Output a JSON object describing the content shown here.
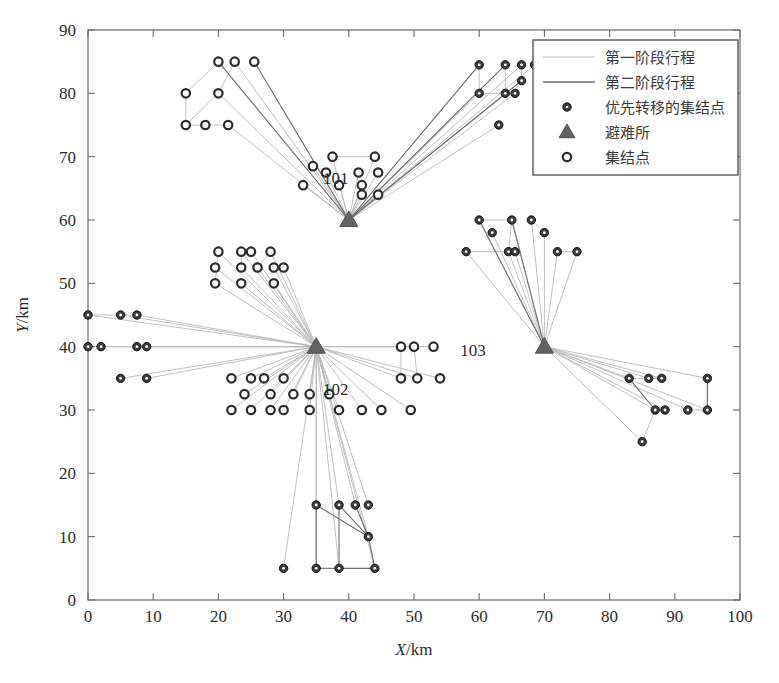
{
  "figure": {
    "background": "#ffffff",
    "axis_color": "#6b6b6b",
    "stage1_color": "#b9b9b9",
    "stage2_color": "#6e6e6e",
    "priority_node_color": "#3a3a3a",
    "assembly_node_color": "#2b2b2b",
    "shelter_color": "#636363"
  },
  "axes": {
    "x_title_var": "X",
    "x_title_unit": "/km",
    "y_title_var": "Y",
    "y_title_unit": "/km",
    "x_ticks": [
      0,
      10,
      20,
      30,
      40,
      50,
      60,
      70,
      80,
      90,
      100
    ],
    "y_ticks": [
      0,
      10,
      20,
      30,
      40,
      50,
      60,
      70,
      80,
      90
    ],
    "xlim": [
      0,
      100
    ],
    "ylim": [
      0,
      90
    ]
  },
  "legend": {
    "position": "top-right",
    "entries": [
      {
        "label": "第一阶段行程",
        "marker": "line-light"
      },
      {
        "label": "第二阶段行程",
        "marker": "line-dark"
      },
      {
        "label": "优先转移的集结点",
        "marker": "filled-circle"
      },
      {
        "label": "避难所",
        "marker": "filled-triangle"
      },
      {
        "label": "集结点",
        "marker": "hollow-circle"
      }
    ]
  },
  "chart_data": {
    "type": "scatter",
    "title": "",
    "xlabel": "X/km",
    "ylabel": "Y/km",
    "xlim": [
      0,
      100
    ],
    "ylim": [
      0,
      90
    ],
    "grid": false,
    "legend_position": "top-right",
    "series": [
      {
        "name": "避难所",
        "marker": "filled-triangle",
        "points": [
          {
            "x": 40,
            "y": 60,
            "label": "101",
            "label_dx": -2,
            "label_dy": -9
          },
          {
            "x": 35,
            "y": 40,
            "label": "102",
            "label_dx": 3,
            "label_dy": 4
          },
          {
            "x": 70,
            "y": 40,
            "label": "103",
            "label_dx": -11,
            "label_dy": -2
          }
        ]
      },
      {
        "name": "优先转移的集结点",
        "marker": "filled-circle",
        "points": [
          {
            "x": 60,
            "y": 84.5
          },
          {
            "x": 64,
            "y": 84.5
          },
          {
            "x": 66.5,
            "y": 84.5
          },
          {
            "x": 68.5,
            "y": 84.5
          },
          {
            "x": 60,
            "y": 80
          },
          {
            "x": 64,
            "y": 80
          },
          {
            "x": 65.5,
            "y": 80
          },
          {
            "x": 66.5,
            "y": 82
          },
          {
            "x": 63,
            "y": 75
          },
          {
            "x": 60,
            "y": 60
          },
          {
            "x": 65,
            "y": 60
          },
          {
            "x": 68,
            "y": 60
          },
          {
            "x": 62,
            "y": 58
          },
          {
            "x": 70,
            "y": 58
          },
          {
            "x": 64.5,
            "y": 55
          },
          {
            "x": 65.5,
            "y": 55
          },
          {
            "x": 72,
            "y": 55
          },
          {
            "x": 75,
            "y": 55
          },
          {
            "x": 58,
            "y": 55
          },
          {
            "x": 83,
            "y": 35
          },
          {
            "x": 86,
            "y": 35
          },
          {
            "x": 88,
            "y": 35
          },
          {
            "x": 95,
            "y": 35
          },
          {
            "x": 87,
            "y": 30
          },
          {
            "x": 88.5,
            "y": 30
          },
          {
            "x": 92,
            "y": 30
          },
          {
            "x": 95,
            "y": 30
          },
          {
            "x": 85,
            "y": 25
          },
          {
            "x": 35,
            "y": 15
          },
          {
            "x": 38.5,
            "y": 15
          },
          {
            "x": 41,
            "y": 15
          },
          {
            "x": 43,
            "y": 15
          },
          {
            "x": 43,
            "y": 10
          },
          {
            "x": 30,
            "y": 5
          },
          {
            "x": 35,
            "y": 5
          },
          {
            "x": 38.5,
            "y": 5
          },
          {
            "x": 44,
            "y": 5
          },
          {
            "x": 0,
            "y": 45
          },
          {
            "x": 5,
            "y": 45
          },
          {
            "x": 7.5,
            "y": 45
          },
          {
            "x": 0,
            "y": 40
          },
          {
            "x": 2,
            "y": 40
          },
          {
            "x": 7.5,
            "y": 40
          },
          {
            "x": 9,
            "y": 40
          },
          {
            "x": 5,
            "y": 35
          },
          {
            "x": 9,
            "y": 35
          }
        ]
      },
      {
        "name": "集结点",
        "marker": "hollow-circle",
        "points": [
          {
            "x": 20,
            "y": 85
          },
          {
            "x": 22.5,
            "y": 85
          },
          {
            "x": 25.5,
            "y": 85
          },
          {
            "x": 15,
            "y": 80
          },
          {
            "x": 20,
            "y": 80
          },
          {
            "x": 15,
            "y": 75
          },
          {
            "x": 18,
            "y": 75
          },
          {
            "x": 21.5,
            "y": 75
          },
          {
            "x": 37.5,
            "y": 70
          },
          {
            "x": 44,
            "y": 70
          },
          {
            "x": 34.5,
            "y": 68.5
          },
          {
            "x": 36.5,
            "y": 67.5
          },
          {
            "x": 41.5,
            "y": 67.5
          },
          {
            "x": 44.5,
            "y": 67.5
          },
          {
            "x": 33,
            "y": 65.5
          },
          {
            "x": 38.5,
            "y": 65.5
          },
          {
            "x": 42,
            "y": 65.5
          },
          {
            "x": 42,
            "y": 64
          },
          {
            "x": 44.5,
            "y": 64
          },
          {
            "x": 20,
            "y": 55
          },
          {
            "x": 23.5,
            "y": 55
          },
          {
            "x": 25,
            "y": 55
          },
          {
            "x": 28,
            "y": 55
          },
          {
            "x": 19.5,
            "y": 52.5
          },
          {
            "x": 23.5,
            "y": 52.5
          },
          {
            "x": 26,
            "y": 52.5
          },
          {
            "x": 28.5,
            "y": 52.5
          },
          {
            "x": 30,
            "y": 52.5
          },
          {
            "x": 19.5,
            "y": 50
          },
          {
            "x": 23.5,
            "y": 50
          },
          {
            "x": 28.5,
            "y": 50
          },
          {
            "x": 48,
            "y": 40
          },
          {
            "x": 50,
            "y": 40
          },
          {
            "x": 53,
            "y": 40
          },
          {
            "x": 22,
            "y": 35
          },
          {
            "x": 25,
            "y": 35
          },
          {
            "x": 27,
            "y": 35
          },
          {
            "x": 30,
            "y": 35
          },
          {
            "x": 48,
            "y": 35
          },
          {
            "x": 50.5,
            "y": 35
          },
          {
            "x": 54,
            "y": 35
          },
          {
            "x": 24,
            "y": 32.5
          },
          {
            "x": 28,
            "y": 32.5
          },
          {
            "x": 31.5,
            "y": 32.5
          },
          {
            "x": 34,
            "y": 32.5
          },
          {
            "x": 37,
            "y": 32.5
          },
          {
            "x": 22,
            "y": 30
          },
          {
            "x": 25,
            "y": 30
          },
          {
            "x": 28,
            "y": 30
          },
          {
            "x": 30,
            "y": 30
          },
          {
            "x": 34,
            "y": 30
          },
          {
            "x": 38.5,
            "y": 30
          },
          {
            "x": 42,
            "y": 30
          },
          {
            "x": 45,
            "y": 30
          },
          {
            "x": 49.5,
            "y": 30
          }
        ]
      }
    ],
    "stage1_edges": [
      [
        20,
        85,
        40,
        60
      ],
      [
        22.5,
        85,
        40,
        60
      ],
      [
        25.5,
        85,
        40,
        60
      ],
      [
        15,
        80,
        20,
        85
      ],
      [
        20,
        80,
        22.5,
        85
      ],
      [
        15,
        80,
        15,
        75
      ],
      [
        15,
        75,
        18,
        75
      ],
      [
        18,
        75,
        21.5,
        75
      ],
      [
        21.5,
        75,
        40,
        60
      ],
      [
        20,
        80,
        40,
        60
      ],
      [
        15,
        75,
        20,
        80
      ],
      [
        37.5,
        70,
        40,
        60
      ],
      [
        44,
        70,
        40,
        60
      ],
      [
        37.5,
        70,
        44,
        70
      ],
      [
        34.5,
        68.5,
        40,
        60
      ],
      [
        36.5,
        67.5,
        40,
        60
      ],
      [
        41.5,
        67.5,
        40,
        60
      ],
      [
        44.5,
        67.5,
        40,
        60
      ],
      [
        33,
        65.5,
        40,
        60
      ],
      [
        38.5,
        65.5,
        40,
        60
      ],
      [
        42,
        65.5,
        40,
        60
      ],
      [
        42,
        64,
        40,
        60
      ],
      [
        44.5,
        64,
        40,
        60
      ],
      [
        60,
        84.5,
        40,
        60
      ],
      [
        64,
        84.5,
        40,
        60
      ],
      [
        66.5,
        84.5,
        40,
        60
      ],
      [
        68.5,
        84.5,
        40,
        60
      ],
      [
        60,
        80,
        40,
        60
      ],
      [
        64,
        80,
        40,
        60
      ],
      [
        65.5,
        80,
        40,
        60
      ],
      [
        66.5,
        82,
        40,
        60
      ],
      [
        63,
        75,
        40,
        60
      ],
      [
        60,
        84.5,
        60,
        80
      ],
      [
        64,
        84.5,
        64,
        80
      ],
      [
        66.5,
        84.5,
        66.5,
        82
      ],
      [
        60,
        80,
        64,
        80
      ],
      [
        20,
        55,
        35,
        40
      ],
      [
        23.5,
        55,
        35,
        40
      ],
      [
        25,
        55,
        35,
        40
      ],
      [
        28,
        55,
        35,
        40
      ],
      [
        19.5,
        52.5,
        35,
        40
      ],
      [
        23.5,
        52.5,
        35,
        40
      ],
      [
        26,
        52.5,
        35,
        40
      ],
      [
        28.5,
        52.5,
        35,
        40
      ],
      [
        30,
        52.5,
        35,
        40
      ],
      [
        19.5,
        50,
        35,
        40
      ],
      [
        23.5,
        50,
        35,
        40
      ],
      [
        28.5,
        50,
        35,
        40
      ],
      [
        20,
        55,
        19.5,
        50
      ],
      [
        23.5,
        55,
        23.5,
        52.5
      ],
      [
        26,
        52.5,
        28,
        55
      ],
      [
        0,
        45,
        35,
        40
      ],
      [
        5,
        45,
        35,
        40
      ],
      [
        7.5,
        45,
        35,
        40
      ],
      [
        0,
        40,
        35,
        40
      ],
      [
        2,
        40,
        35,
        40
      ],
      [
        7.5,
        40,
        35,
        40
      ],
      [
        9,
        40,
        35,
        40
      ],
      [
        5,
        35,
        35,
        40
      ],
      [
        9,
        35,
        35,
        40
      ],
      [
        0,
        45,
        5,
        45
      ],
      [
        5,
        45,
        7.5,
        45
      ],
      [
        22,
        35,
        35,
        40
      ],
      [
        25,
        35,
        35,
        40
      ],
      [
        27,
        35,
        35,
        40
      ],
      [
        30,
        35,
        35,
        40
      ],
      [
        24,
        32.5,
        35,
        40
      ],
      [
        28,
        32.5,
        35,
        40
      ],
      [
        31.5,
        32.5,
        35,
        40
      ],
      [
        34,
        32.5,
        35,
        40
      ],
      [
        37,
        32.5,
        35,
        40
      ],
      [
        22,
        30,
        35,
        40
      ],
      [
        25,
        30,
        35,
        40
      ],
      [
        28,
        30,
        35,
        40
      ],
      [
        30,
        30,
        35,
        40
      ],
      [
        34,
        30,
        35,
        40
      ],
      [
        38.5,
        30,
        35,
        40
      ],
      [
        42,
        30,
        35,
        40
      ],
      [
        45,
        30,
        35,
        40
      ],
      [
        49.5,
        30,
        35,
        40
      ],
      [
        48,
        40,
        35,
        40
      ],
      [
        50,
        40,
        35,
        40
      ],
      [
        53,
        40,
        35,
        40
      ],
      [
        48,
        35,
        35,
        40
      ],
      [
        50.5,
        35,
        35,
        40
      ],
      [
        54,
        35,
        35,
        40
      ],
      [
        48,
        40,
        48,
        35
      ],
      [
        50,
        40,
        50.5,
        35
      ],
      [
        60,
        60,
        70,
        40
      ],
      [
        65,
        60,
        70,
        40
      ],
      [
        68,
        60,
        70,
        40
      ],
      [
        62,
        58,
        70,
        40
      ],
      [
        70,
        58,
        70,
        40
      ],
      [
        64.5,
        55,
        70,
        40
      ],
      [
        65.5,
        55,
        70,
        40
      ],
      [
        72,
        55,
        70,
        40
      ],
      [
        75,
        55,
        70,
        40
      ],
      [
        58,
        55,
        70,
        40
      ],
      [
        60,
        60,
        65,
        60
      ],
      [
        65,
        60,
        64.5,
        55
      ],
      [
        68,
        60,
        70,
        58
      ],
      [
        72,
        55,
        75,
        55
      ],
      [
        58,
        55,
        64.5,
        55
      ],
      [
        83,
        35,
        70,
        40
      ],
      [
        86,
        35,
        70,
        40
      ],
      [
        88,
        35,
        70,
        40
      ],
      [
        95,
        35,
        70,
        40
      ],
      [
        87,
        30,
        70,
        40
      ],
      [
        88.5,
        30,
        70,
        40
      ],
      [
        92,
        30,
        70,
        40
      ],
      [
        95,
        30,
        70,
        40
      ],
      [
        85,
        25,
        70,
        40
      ],
      [
        83,
        35,
        86,
        35
      ],
      [
        86,
        35,
        88,
        35
      ],
      [
        95,
        35,
        95,
        30
      ],
      [
        92,
        30,
        95,
        30
      ],
      [
        85,
        25,
        87,
        30
      ],
      [
        35,
        15,
        35,
        40
      ],
      [
        38.5,
        15,
        35,
        40
      ],
      [
        41,
        15,
        35,
        40
      ],
      [
        43,
        15,
        35,
        40
      ],
      [
        43,
        10,
        35,
        40
      ],
      [
        30,
        5,
        35,
        40
      ],
      [
        35,
        5,
        35,
        40
      ],
      [
        38.5,
        5,
        35,
        40
      ],
      [
        44,
        5,
        35,
        40
      ]
    ],
    "stage2_edges": [
      [
        25.5,
        85,
        40,
        60
      ],
      [
        20,
        85,
        40,
        60
      ],
      [
        60,
        84.5,
        40,
        60
      ],
      [
        64,
        84.5,
        40,
        60
      ],
      [
        66.5,
        82,
        40,
        60
      ],
      [
        60,
        60,
        70,
        40
      ],
      [
        65,
        60,
        70,
        40
      ],
      [
        35,
        15,
        43,
        10
      ],
      [
        38.5,
        15,
        43,
        10
      ],
      [
        41,
        15,
        43,
        10
      ],
      [
        43,
        10,
        44,
        5
      ],
      [
        35,
        5,
        38.5,
        5
      ],
      [
        38.5,
        5,
        44,
        5
      ],
      [
        35,
        15,
        35,
        5
      ],
      [
        38.5,
        15,
        38.5,
        5
      ],
      [
        83,
        35,
        87,
        30
      ],
      [
        95,
        35,
        95,
        30
      ]
    ]
  },
  "shelter_labels": [
    "101",
    "102",
    "103"
  ]
}
